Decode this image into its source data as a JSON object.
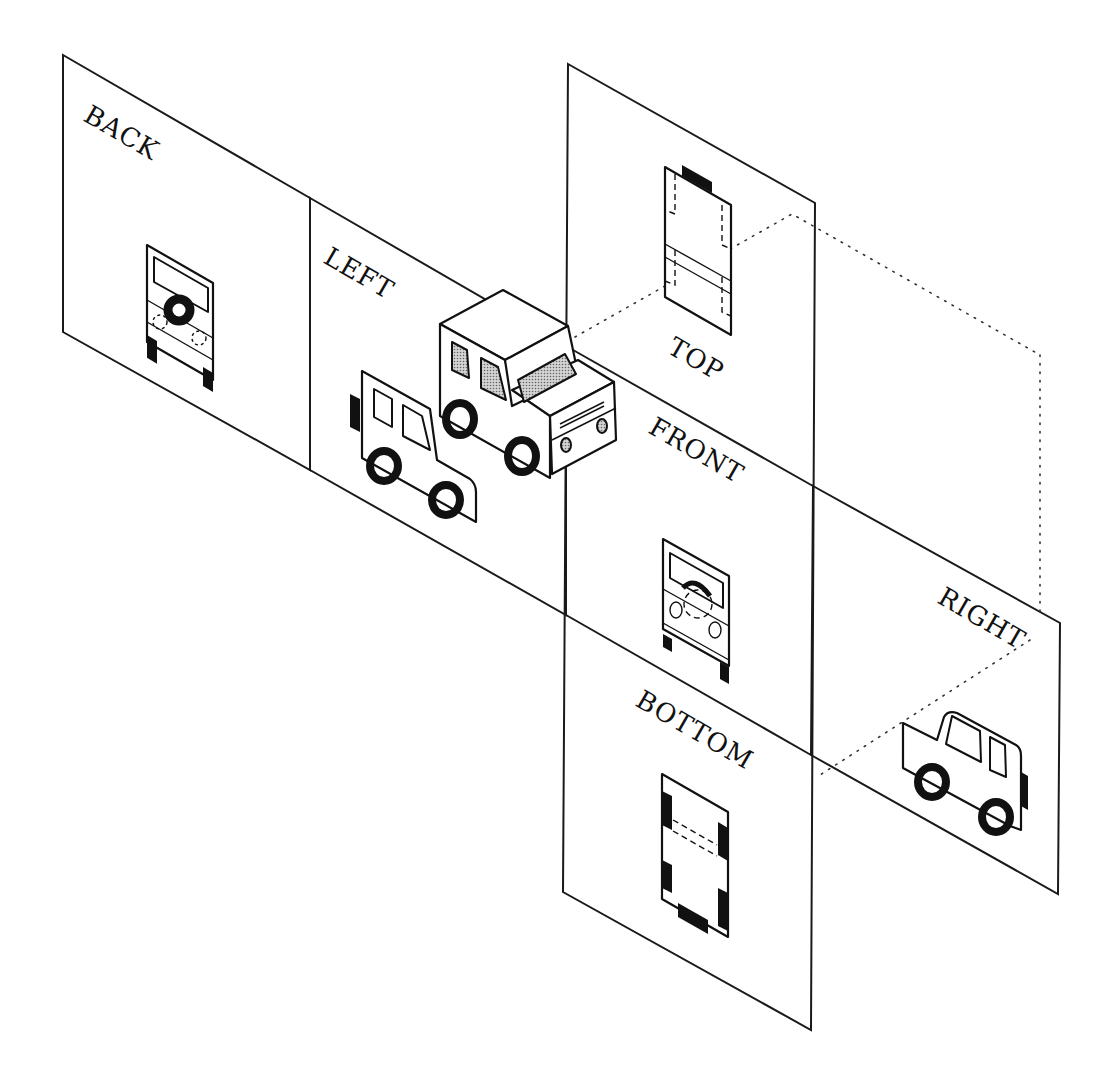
{
  "diagram": {
    "type": "orthographic-projection-views",
    "colors": {
      "line": "#111111",
      "background": "#ffffff",
      "glass_stipple": "#9a9a9a"
    },
    "planes": [
      {
        "id": "back",
        "label": "BACK"
      },
      {
        "id": "left",
        "label": "LEFT"
      },
      {
        "id": "top",
        "label": "TOP"
      },
      {
        "id": "front",
        "label": "FRONT"
      },
      {
        "id": "right",
        "label": "RIGHT"
      },
      {
        "id": "bottom",
        "label": "BOTTOM"
      }
    ],
    "center_object": "isometric 3D vehicle",
    "projection_lines": "dotted"
  }
}
